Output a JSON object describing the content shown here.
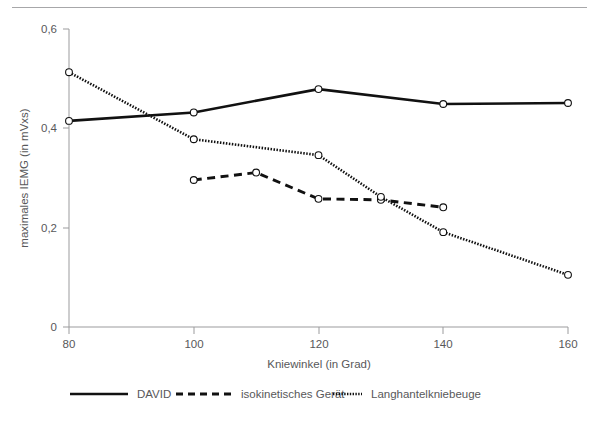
{
  "figure": {
    "divider_present": true
  },
  "chart_data": {
    "type": "line",
    "title": "",
    "subtitle": "",
    "xlabel": "Kniewinkel (in Grad)",
    "ylabel": "maximales IEMG (in mVxs)",
    "xlim": [
      80,
      160
    ],
    "ylim": [
      0,
      0.6
    ],
    "xticks": [
      80,
      100,
      120,
      140,
      160
    ],
    "xtick_labels": [
      "80",
      "100",
      "120",
      "140",
      "160"
    ],
    "yticks": [
      0,
      0.2,
      0.4,
      0.6
    ],
    "ytick_labels": [
      "0",
      "0,2",
      "0,4",
      "0,6"
    ],
    "grid": false,
    "legend_position": "bottom",
    "series": [
      {
        "name": "DAVID",
        "style": "solid",
        "color": "#111111",
        "marker": "open-circle",
        "x": [
          80,
          100,
          120,
          140,
          160
        ],
        "values": [
          0.415,
          0.432,
          0.479,
          0.449,
          0.451
        ]
      },
      {
        "name": "isokinetisches Gerät",
        "style": "dashed",
        "color": "#111111",
        "marker": "open-circle",
        "x": [
          100,
          110,
          120,
          130,
          140
        ],
        "values": [
          0.296,
          0.311,
          0.258,
          0.256,
          0.241
        ]
      },
      {
        "name": "Langhantelkniebeuge",
        "style": "dotted",
        "color": "#111111",
        "marker": "open-circle",
        "x": [
          80,
          100,
          120,
          130,
          140,
          160
        ],
        "values": [
          0.513,
          0.378,
          0.346,
          0.262,
          0.191,
          0.105
        ]
      }
    ]
  },
  "legend": {
    "items": [
      {
        "label": "DAVID",
        "style": "solid"
      },
      {
        "label": "isokinetisches Gerät",
        "style": "dashed"
      },
      {
        "label": "Langhantelkniebeuge",
        "style": "dotted"
      }
    ]
  }
}
